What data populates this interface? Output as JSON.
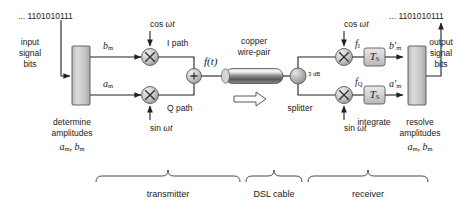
{
  "diagram": {
    "input_bits": "... 1101010111",
    "output_bits": "... 1101010111",
    "input_label_line1": "input",
    "input_label_line2": "signal",
    "input_label_line3": "bits",
    "output_label_line1": "output",
    "output_label_line2": "signal",
    "output_label_line3": "bits"
  },
  "transmitter": {
    "block_caption_line1": "determine",
    "block_caption_line2": "amplitudes",
    "block_caption_math": "aₘ, bₘ",
    "amp_top": "b",
    "amp_top_sub": "m",
    "amp_bottom": "a",
    "amp_bottom_sub": "m",
    "carrier_top": "cos ωt",
    "carrier_bottom": "sin ωt",
    "path_top": "I path",
    "path_bottom": "Q path",
    "sum_symbol": "+",
    "signal": "f(t)",
    "mixer_symbol": "×"
  },
  "cable": {
    "caption_line1": "copper",
    "caption_line2": "wire-pair"
  },
  "receiver": {
    "splitter_label": "splitter",
    "splitter_loss": "3 dB",
    "carrier_top": "cos ωt",
    "carrier_bottom": "sin ωt",
    "mix_out_top": "f",
    "mix_out_top_sub": "I",
    "mix_out_bottom": "f",
    "mix_out_bottom_sub": "Q",
    "integrator_label": "T",
    "integrator_sub": "S",
    "integrate_caption": "integrate",
    "amp_top": "b'",
    "amp_top_sub": "m",
    "amp_bottom": "a'",
    "amp_bottom_sub": "m",
    "block_caption_line1": "resolve",
    "block_caption_line2": "amplitudes",
    "block_caption_math": "aₘ, bₘ",
    "mixer_symbol": "×"
  },
  "sections": [
    {
      "name": "transmitter",
      "label": "transmitter"
    },
    {
      "name": "dsl-cable",
      "label": "DSL cable"
    },
    {
      "name": "receiver",
      "label": "receiver"
    }
  ],
  "colors": {
    "line": "#222222",
    "block_fill_light": "#d8d8d8",
    "block_fill_dark": "#9a9a9a",
    "text": "#1a1a1a"
  }
}
